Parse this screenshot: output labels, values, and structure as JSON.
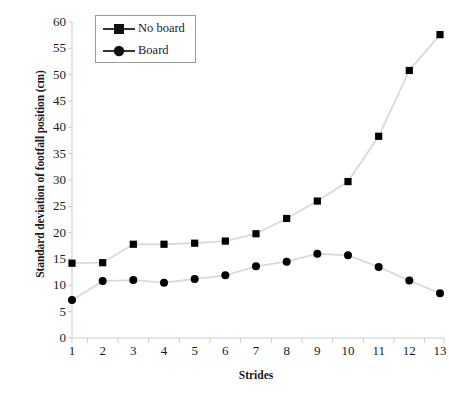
{
  "chart_data": {
    "type": "line",
    "title": "",
    "xlabel": "Strides",
    "ylabel": "Standard deviation of footfall position (cm)",
    "categories": [
      "1",
      "2",
      "3",
      "4",
      "5",
      "6",
      "7",
      "8",
      "9",
      "10",
      "11",
      "12",
      "13"
    ],
    "x": [
      1,
      2,
      3,
      4,
      5,
      6,
      7,
      8,
      9,
      10,
      11,
      12,
      13
    ],
    "xlim": [
      1,
      13
    ],
    "ylim": [
      0,
      60
    ],
    "y_ticks": [
      0,
      5,
      10,
      15,
      20,
      25,
      30,
      35,
      40,
      45,
      50,
      55,
      60
    ],
    "y_tick_labels": [
      "0",
      "5",
      "10",
      "15",
      "20",
      "25",
      "30",
      "35",
      "40",
      "45",
      "50",
      "55",
      "60"
    ],
    "grid": false,
    "legend_position": "upper left",
    "series": [
      {
        "name": "No board",
        "marker": "square",
        "marker_color": "#000000",
        "line_color": "#d9d9d9",
        "values": [
          14.2,
          14.3,
          17.8,
          17.8,
          18.0,
          18.4,
          19.8,
          22.7,
          26.0,
          29.7,
          38.3,
          50.8,
          57.6
        ]
      },
      {
        "name": "Board",
        "marker": "circle",
        "marker_color": "#000000",
        "line_color": "#d9d9d9",
        "values": [
          7.2,
          10.8,
          11.0,
          10.5,
          11.2,
          11.9,
          13.6,
          14.5,
          16.0,
          15.7,
          13.5,
          10.9,
          8.5
        ]
      }
    ]
  },
  "axes": {
    "y_title": "Standard deviation of footfall position (cm)",
    "x_title": "Strides",
    "axis_color": "#cfcfcf"
  },
  "legend": {
    "entries": [
      {
        "label": "No board",
        "marker": "square"
      },
      {
        "label": "Board",
        "marker": "circle"
      }
    ]
  },
  "caption": {
    "text": ""
  }
}
